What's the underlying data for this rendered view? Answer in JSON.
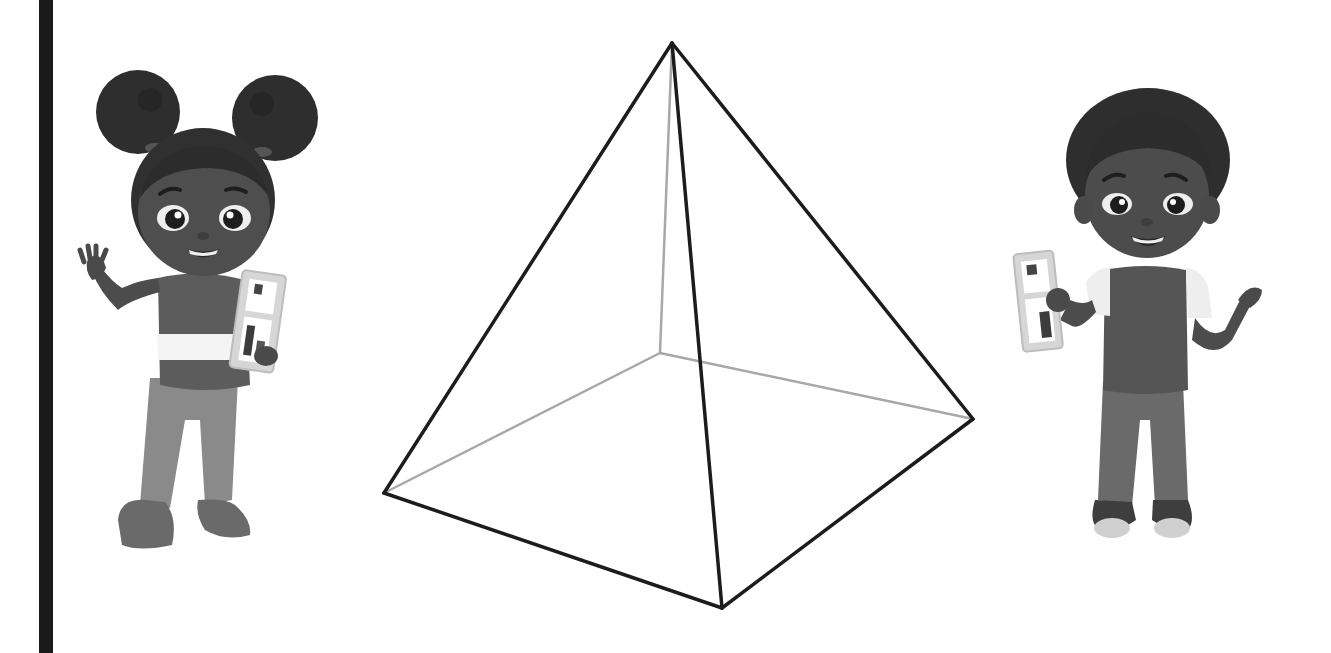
{
  "page": {
    "background": "#ffffff",
    "left_bar": {
      "color": "#1a1a1a",
      "x": 39,
      "width": 14
    }
  },
  "pyramid": {
    "type": "square-pyramid-wireframe",
    "visible_edge_color": "#1c1c1c",
    "hidden_edge_color": "#a8a8a8",
    "vertices": {
      "apex": [
        672,
        43
      ],
      "left": [
        384,
        493
      ],
      "front": [
        722,
        608
      ],
      "right": [
        973,
        419
      ],
      "back_hidden": [
        660,
        353
      ]
    },
    "visible_edges": [
      [
        "apex",
        "left"
      ],
      [
        "apex",
        "front"
      ],
      [
        "apex",
        "right"
      ],
      [
        "left",
        "front"
      ],
      [
        "front",
        "right"
      ]
    ],
    "hidden_edges": [
      [
        "apex",
        "back_hidden"
      ],
      [
        "left",
        "back_hidden"
      ],
      [
        "right",
        "back_hidden"
      ]
    ]
  },
  "characters": [
    {
      "name": "girl",
      "pose": "waving left hand",
      "holding": "abacus",
      "hair": "two puffs",
      "position": "left"
    },
    {
      "name": "boy",
      "pose": "open right hand",
      "holding": "abacus",
      "hair": "curly",
      "position": "right"
    }
  ]
}
